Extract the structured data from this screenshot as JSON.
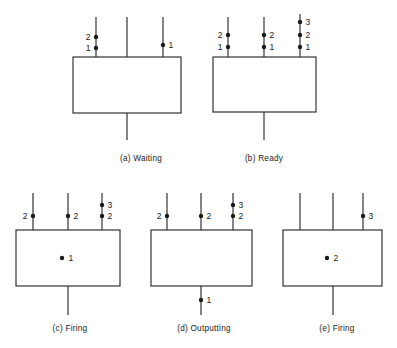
{
  "figure": {
    "canvas": {
      "width": 397,
      "height": 348
    },
    "colors": {
      "background": "#ffffff",
      "stroke": "#2b2b2b",
      "token": "#1a1a1a",
      "text": "#1a1a1a"
    },
    "geometry": {
      "dot_radius": 2.2,
      "center_dot_radius": 2.2,
      "label_offset": 5.5,
      "caption_font_size": 8.2,
      "label_font_size": 8.5
    },
    "panels": [
      {
        "id": "panel-a",
        "caption": "(a)  Waiting",
        "caption_x": 141,
        "caption_y": 161,
        "box": {
          "x": 73,
          "y": 57,
          "width": 108,
          "height": 56
        },
        "inputs": [
          {
            "id": "a-in-1",
            "x": 96,
            "y_top": 17,
            "tokens": [
              {
                "value": "2",
                "y": 37,
                "side": "left"
              },
              {
                "value": "1",
                "y": 48,
                "side": "left"
              }
            ]
          },
          {
            "id": "a-in-2",
            "x": 127,
            "y_top": 17,
            "tokens": []
          },
          {
            "id": "a-in-3",
            "x": 163,
            "y_top": 17,
            "tokens": [
              {
                "value": "1",
                "y": 45,
                "side": "right"
              }
            ]
          }
        ],
        "outputs": [
          {
            "id": "a-out-1",
            "x": 127,
            "y_bottom": 140,
            "tokens": []
          }
        ],
        "center_tokens": []
      },
      {
        "id": "panel-b",
        "caption": "(b)  Ready",
        "caption_x": 264,
        "caption_y": 161,
        "box": {
          "x": 213,
          "y": 57,
          "width": 103,
          "height": 55
        },
        "inputs": [
          {
            "id": "b-in-1",
            "x": 228,
            "y_top": 17,
            "tokens": [
              {
                "value": "2",
                "y": 35,
                "side": "left"
              },
              {
                "value": "1",
                "y": 47,
                "side": "left"
              }
            ]
          },
          {
            "id": "b-in-2",
            "x": 264,
            "y_top": 17,
            "tokens": [
              {
                "value": "2",
                "y": 35,
                "side": "right"
              },
              {
                "value": "1",
                "y": 47,
                "side": "right"
              }
            ]
          },
          {
            "id": "b-in-3",
            "x": 300,
            "y_top": 14,
            "tokens": [
              {
                "value": "3",
                "y": 22,
                "side": "right"
              },
              {
                "value": "2",
                "y": 35,
                "side": "right"
              },
              {
                "value": "1",
                "y": 47,
                "side": "right"
              }
            ]
          }
        ],
        "outputs": [
          {
            "id": "b-out-1",
            "x": 264,
            "y_bottom": 140,
            "tokens": []
          }
        ],
        "center_tokens": []
      },
      {
        "id": "panel-c",
        "caption": "(c)  Firing",
        "caption_x": 70,
        "caption_y": 331,
        "box": {
          "x": 16,
          "y": 230,
          "width": 104,
          "height": 56
        },
        "inputs": [
          {
            "id": "c-in-1",
            "x": 33,
            "y_top": 193,
            "tokens": [
              {
                "value": "2",
                "y": 216,
                "side": "left"
              }
            ]
          },
          {
            "id": "c-in-2",
            "x": 68,
            "y_top": 193,
            "tokens": [
              {
                "value": "2",
                "y": 216,
                "side": "right"
              }
            ]
          },
          {
            "id": "c-in-3",
            "x": 102,
            "y_top": 193,
            "tokens": [
              {
                "value": "3",
                "y": 205,
                "side": "right"
              },
              {
                "value": "2",
                "y": 216,
                "side": "right"
              }
            ]
          }
        ],
        "outputs": [
          {
            "id": "c-out-1",
            "x": 68,
            "y_bottom": 315,
            "tokens": []
          }
        ],
        "center_tokens": [
          {
            "value": "1",
            "x": 62,
            "y": 258,
            "side": "right"
          }
        ]
      },
      {
        "id": "panel-d",
        "caption": "(d)  Outputting",
        "caption_x": 204,
        "caption_y": 331,
        "box": {
          "x": 151,
          "y": 230,
          "width": 101,
          "height": 56
        },
        "inputs": [
          {
            "id": "d-in-1",
            "x": 167,
            "y_top": 193,
            "tokens": [
              {
                "value": "2",
                "y": 216,
                "side": "left"
              }
            ]
          },
          {
            "id": "d-in-2",
            "x": 201,
            "y_top": 193,
            "tokens": [
              {
                "value": "2",
                "y": 216,
                "side": "right"
              }
            ]
          },
          {
            "id": "d-in-3",
            "x": 233,
            "y_top": 193,
            "tokens": [
              {
                "value": "3",
                "y": 205,
                "side": "right"
              },
              {
                "value": "2",
                "y": 216,
                "side": "right"
              }
            ]
          }
        ],
        "outputs": [
          {
            "id": "d-out-1",
            "x": 201,
            "y_bottom": 315,
            "tokens": [
              {
                "value": "1",
                "y": 300,
                "side": "right"
              }
            ]
          }
        ],
        "center_tokens": []
      },
      {
        "id": "panel-e",
        "caption": "(e)  Firing",
        "caption_x": 337,
        "caption_y": 331,
        "box": {
          "x": 283,
          "y": 230,
          "width": 99,
          "height": 56
        },
        "inputs": [
          {
            "id": "e-in-1",
            "x": 300,
            "y_top": 193,
            "tokens": []
          },
          {
            "id": "e-in-2",
            "x": 333,
            "y_top": 193,
            "tokens": []
          },
          {
            "id": "e-in-3",
            "x": 363,
            "y_top": 193,
            "tokens": [
              {
                "value": "3",
                "y": 216,
                "side": "right"
              }
            ]
          }
        ],
        "outputs": [
          {
            "id": "e-out-1",
            "x": 333,
            "y_bottom": 315,
            "tokens": []
          }
        ],
        "center_tokens": [
          {
            "value": "2",
            "x": 327,
            "y": 258,
            "side": "right"
          }
        ]
      }
    ]
  }
}
